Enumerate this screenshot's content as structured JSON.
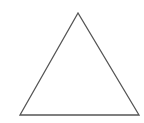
{
  "diagram": {
    "shape": "triangle",
    "stroke_color": "#555555",
    "fill_color": "#ffffff",
    "vertices": [
      [
        78,
        13
      ],
      [
        20,
        115
      ],
      [
        139,
        115
      ]
    ]
  }
}
